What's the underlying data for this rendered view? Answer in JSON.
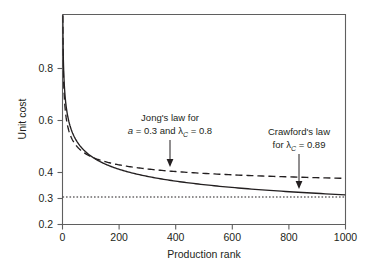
{
  "figure": {
    "background_color": "#ffffff",
    "ink_color": "#231f20",
    "axis_color": "#5f5f5f"
  },
  "chart_data": {
    "type": "line",
    "title": "",
    "xlabel": "Production rank",
    "ylabel": "Unit cost",
    "xlim": [
      0,
      1000
    ],
    "ylim": [
      0.2,
      1.0
    ],
    "xticks": [
      0,
      200,
      400,
      600,
      800,
      1000
    ],
    "xtick_labels": [
      "0",
      "200",
      "400",
      "600",
      "800",
      "1000"
    ],
    "yticks": [
      0.2,
      0.3,
      0.4,
      0.6,
      0.8
    ],
    "ytick_labels": [
      "0.2",
      "0.3",
      "0.4",
      "0.6",
      "0.8"
    ],
    "grid": false,
    "legend": "annotations-with-arrows",
    "series": [
      {
        "name": "Crawford's law",
        "style": "solid",
        "formula": "C(x) = x^log2(0.89)",
        "lambda_C": 0.89,
        "x": [
          1,
          5,
          10,
          20,
          30,
          50,
          75,
          100,
          150,
          200,
          250,
          300,
          400,
          500,
          600,
          700,
          800,
          900,
          1000
        ],
        "y": [
          1.0,
          0.797,
          0.724,
          0.657,
          0.621,
          0.577,
          0.544,
          0.523,
          0.494,
          0.475,
          0.461,
          0.45,
          0.433,
          0.421,
          0.411,
          0.404,
          0.397,
          0.392,
          0.387
        ]
      },
      {
        "name": "Jong's law",
        "style": "dashed",
        "formula": "J(x) = a + (1-a) * x^log2(0.8)",
        "a": 0.3,
        "lambda_C": 0.8,
        "x": [
          1,
          5,
          10,
          20,
          30,
          50,
          75,
          100,
          150,
          200,
          250,
          300,
          400,
          500,
          600,
          700,
          800,
          900,
          1000
        ],
        "y": [
          1.0,
          0.748,
          0.658,
          0.586,
          0.549,
          0.505,
          0.475,
          0.456,
          0.43,
          0.413,
          0.401,
          0.391,
          0.377,
          0.367,
          0.359,
          0.353,
          0.348,
          0.343,
          0.339
        ]
      },
      {
        "name": "Incompressible cost asymptote",
        "style": "dotted",
        "constant_value": 0.305,
        "x": [
          0,
          1000
        ],
        "y": [
          0.305,
          0.305
        ]
      }
    ],
    "annotations": [
      {
        "id": "jong-annotation",
        "line1": "Jong's law for",
        "line2_prefix": "a",
        "line2_mid": " = 0.3 and ",
        "line2_symbol": "λ",
        "line2_subscript": "C",
        "line2_suffix": " = 0.8",
        "points_to_series": "Jong's law",
        "arrow_target": {
          "x": 405,
          "y": 0.412
        }
      },
      {
        "id": "crawford-annotation",
        "line1": "Crawford's law",
        "line2_prefix": "for ",
        "line2_symbol": "λ",
        "line2_subscript": "C",
        "line2_suffix": " = 0.89",
        "points_to_series": "Crawford's law",
        "arrow_target": {
          "x": 830,
          "y": 0.345
        }
      }
    ]
  }
}
